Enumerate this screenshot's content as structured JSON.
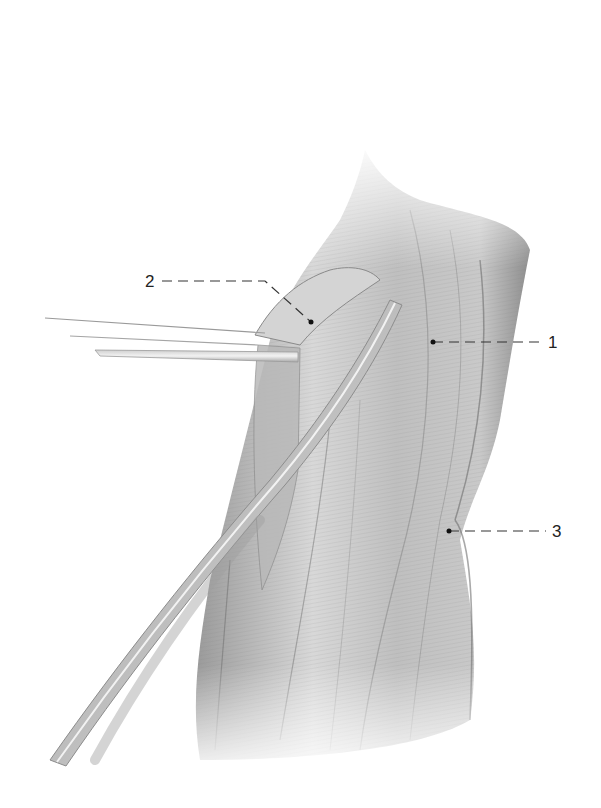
{
  "figure": {
    "type": "anatomical-illustration",
    "style": "grayscale pencil drawing",
    "background_color": "#ffffff",
    "ink_color": "#222222"
  },
  "labels": [
    {
      "id": "1",
      "text": "1",
      "x": 549,
      "y": 342,
      "pointer": [
        433,
        342
      ]
    },
    {
      "id": "2",
      "text": "2",
      "x": 146,
      "y": 281,
      "pointer": [
        311,
        322
      ]
    },
    {
      "id": "3",
      "text": "3",
      "x": 553,
      "y": 531,
      "pointer": [
        449,
        531
      ]
    }
  ],
  "elements": {
    "retractor_band": "horizontal retracting strips from left",
    "instrument": "long curved rod entering from bottom-left",
    "main_muscle": "central vertical muscle belly"
  }
}
